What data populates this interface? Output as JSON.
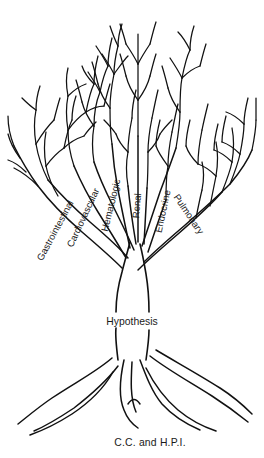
{
  "figure": {
    "kind": "tree-diagram",
    "title_visible": false,
    "background_color": "#ffffff",
    "stroke_color": "#111111"
  },
  "labels": {
    "trunk": "Hypothesis",
    "roots": "C.C. and H.P.I.",
    "branches": [
      {
        "text": "Gastrointestinal",
        "rotate": -62,
        "x": 58,
        "y": 232
      },
      {
        "text": "Cardiovascular",
        "rotate": -65,
        "x": 86,
        "y": 219
      },
      {
        "text": "Hematologic",
        "rotate": -76,
        "x": 114,
        "y": 206
      },
      {
        "text": "Renal",
        "rotate": -85,
        "x": 140,
        "y": 206
      },
      {
        "text": "Endocrine",
        "rotate": -78,
        "x": 166,
        "y": 212
      },
      {
        "text": "Pulmonary",
        "rotate": 56,
        "x": 186,
        "y": 216
      }
    ]
  },
  "chart_data": {
    "type": "diagram",
    "title": "",
    "nodes": [
      {
        "id": "roots",
        "label": "C.C. and H.P.I.",
        "level": "roots",
        "role": "foundation"
      },
      {
        "id": "trunk",
        "label": "Hypothesis",
        "level": "trunk",
        "role": "central"
      },
      {
        "id": "gi",
        "label": "Gastrointestinal",
        "level": "branch",
        "role": "system"
      },
      {
        "id": "cv",
        "label": "Cardiovascular",
        "level": "branch",
        "role": "system"
      },
      {
        "id": "heme",
        "label": "Hematologic",
        "level": "branch",
        "role": "system"
      },
      {
        "id": "renal",
        "label": "Renal",
        "level": "branch",
        "role": "system"
      },
      {
        "id": "endo",
        "label": "Endocrine",
        "level": "branch",
        "role": "system"
      },
      {
        "id": "pulm",
        "label": "Pulmonary",
        "level": "branch",
        "role": "system"
      }
    ],
    "edges": [
      {
        "from": "roots",
        "to": "trunk"
      },
      {
        "from": "trunk",
        "to": "gi"
      },
      {
        "from": "trunk",
        "to": "cv"
      },
      {
        "from": "trunk",
        "to": "heme"
      },
      {
        "from": "trunk",
        "to": "renal"
      },
      {
        "from": "trunk",
        "to": "endo"
      },
      {
        "from": "trunk",
        "to": "pulm"
      }
    ]
  }
}
